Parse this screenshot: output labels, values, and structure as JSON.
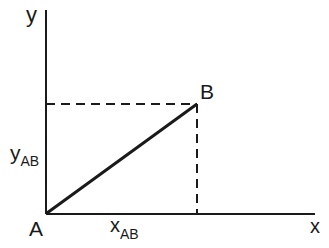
{
  "diagram": {
    "axes": {
      "x_label": "x",
      "y_label": "y",
      "color": "#1a1a1a"
    },
    "points": [
      {
        "name": "A",
        "label": "A"
      },
      {
        "name": "B",
        "label": "B"
      }
    ],
    "projections": {
      "x": {
        "base": "x",
        "sub": "AB"
      },
      "y": {
        "base": "y",
        "sub": "AB"
      }
    },
    "segment": {
      "from": "A",
      "to": "B"
    }
  }
}
